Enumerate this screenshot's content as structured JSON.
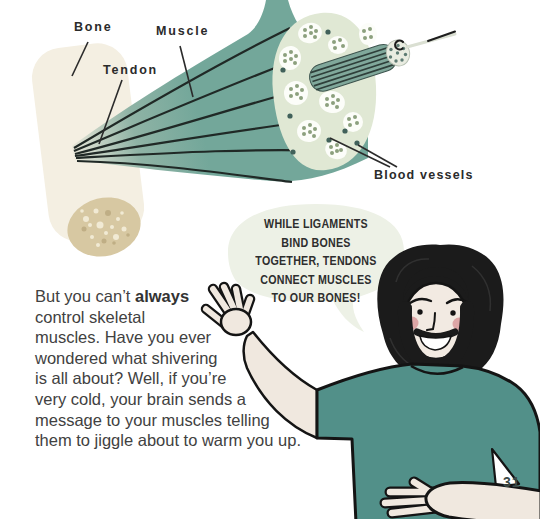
{
  "page": {
    "number": "31"
  },
  "diagram": {
    "labels": {
      "bone": "Bone",
      "muscle": "Muscle",
      "tendon": "Tendon",
      "blood_vessels": "Blood vessels"
    },
    "colors": {
      "muscle_teal": "#73a79a",
      "bone_cream": "#f4efe2",
      "bone_marrow_tan": "#d7c8a2",
      "cross_section_green": "#e0e8d4",
      "blood_vessel_dot": "#41615a"
    }
  },
  "speech_bubble": {
    "background": "#edf1e6",
    "lines": [
      "WHILE LIGAMENTS",
      "BIND BONES",
      "TOGETHER, TENDONS",
      "CONNECT MUSCLES",
      "TO OUR BONES!"
    ]
  },
  "paragraph": {
    "line1_pre": "But you can’t ",
    "line1_bold": "always",
    "lines_rest": [
      "control skeletal",
      "muscles. Have you ever",
      "wondered what shivering",
      "is all about? Well, if you’re",
      "very cold, your brain sends a",
      "message to your muscles telling",
      "them to jiggle about to warm you up."
    ]
  },
  "character": {
    "shirt_color": "#529089",
    "skin_color": "#f0e8df",
    "hair_color": "#1b1b1b",
    "cheek_color": "#dda6a6"
  }
}
